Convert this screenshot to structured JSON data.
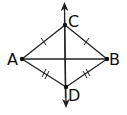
{
  "diagram": {
    "type": "kite with perpendicular diagonals",
    "points": {
      "A": {
        "label": "A",
        "x": 22,
        "y": 59
      },
      "B": {
        "label": "B",
        "x": 107,
        "y": 59
      },
      "C": {
        "label": "C",
        "x": 65,
        "y": 25
      },
      "D": {
        "label": "D",
        "x": 66,
        "y": 87
      }
    },
    "segments": [
      {
        "from": "A",
        "to": "C",
        "ticks": 1
      },
      {
        "from": "C",
        "to": "B",
        "ticks": 1
      },
      {
        "from": "A",
        "to": "D",
        "ticks": 2
      },
      {
        "from": "D",
        "to": "B",
        "ticks": 2
      },
      {
        "from": "A",
        "to": "B",
        "ticks": 0
      }
    ],
    "line_CD": {
      "description": "line through C and D with arrows at both ends"
    },
    "colors": {
      "stroke": "#222222",
      "background": "#ffffff"
    }
  }
}
